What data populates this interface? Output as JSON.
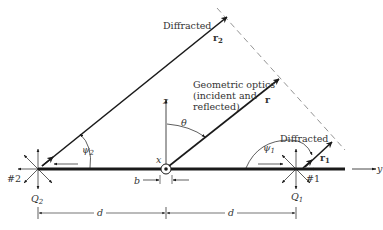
{
  "diagram": {
    "labels": {
      "diffracted_top": "Diffracted",
      "r2": "r",
      "r2_sub": "2",
      "geo_line1": "Geometric optics",
      "geo_line2": "(incident and",
      "geo_line3": "reflected)",
      "r": "r",
      "z_axis": "z",
      "theta": "θ",
      "psi2": "ψ",
      "psi2_sub": "2",
      "psi1": "ψ",
      "psi1_sub": "1",
      "diffracted_right": "Diffracted",
      "r1": "r",
      "r1_sub": "1",
      "y_axis": "y",
      "x_axis": "x",
      "edge2": "#2",
      "edge1": "#1",
      "q2": "Q",
      "q2_sub": "2",
      "q1": "Q",
      "q1_sub": "1",
      "b": "b",
      "d_left": "d",
      "d_right": "d"
    },
    "colors": {
      "ink": "#1a1a1a",
      "text": "#333333",
      "dashed": "#888888"
    }
  }
}
